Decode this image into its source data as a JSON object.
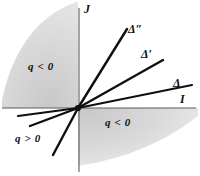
{
  "figure": {
    "type": "diagram",
    "background_color": "#ffffff",
    "line_color": "#101010",
    "axis_color": "#555555",
    "shade_color": "#dcdcdc",
    "width": 200,
    "height": 176,
    "origin": {
      "x": 78,
      "y": 108
    }
  },
  "axes": {
    "vertical": {
      "label": "J",
      "x": 79,
      "y_top": 8,
      "y_bottom": 172
    },
    "horizontal": {
      "label": "I",
      "y": 108,
      "x_left": 2,
      "x_right": 196
    }
  },
  "lines": [
    {
      "name": "delta",
      "label": "Δ",
      "slope_description": "shallow positive slope",
      "x2": 192,
      "y2": 85,
      "x_back": 18,
      "y_back": 116
    },
    {
      "name": "delta-prime",
      "label": "Δ′",
      "slope_description": "medium positive slope",
      "x2": 163,
      "y2": 60,
      "x_back": 30,
      "y_back": 126
    },
    {
      "name": "delta-double-prime",
      "label": "Δ″",
      "slope_description": "steep positive slope",
      "x2": 127,
      "y2": 29,
      "x_back": 53,
      "y_back": 155
    }
  ],
  "regions": [
    {
      "name": "upper-left-sector",
      "label": "q < 0",
      "sign": "negative",
      "quadrant": "upper-left"
    },
    {
      "name": "lower-left-sector",
      "label": "q > 0",
      "sign": "positive",
      "quadrant": "lower-left"
    },
    {
      "name": "lower-right-sector",
      "label": "q < 0",
      "sign": "negative",
      "quadrant": "lower-right"
    }
  ]
}
